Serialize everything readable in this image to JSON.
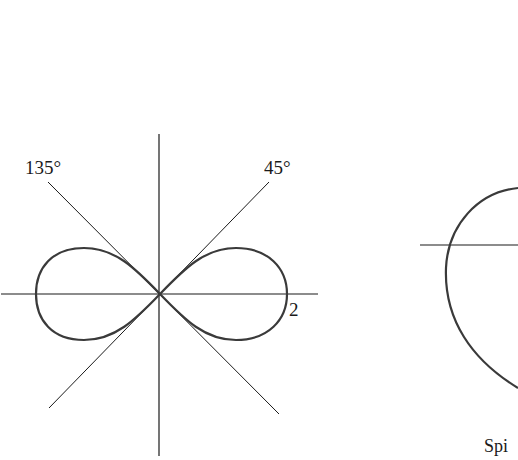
{
  "figures": [
    {
      "name": "lemniscate",
      "labels": {
        "angle_left": "135°",
        "angle_right": "45°",
        "radius_value": "2"
      }
    },
    {
      "name": "spiral-partial",
      "caption": "Spi"
    }
  ],
  "colors": {
    "curve": "#3a3a3a",
    "axis": "#1a1a1a",
    "background": "#ffffff"
  }
}
